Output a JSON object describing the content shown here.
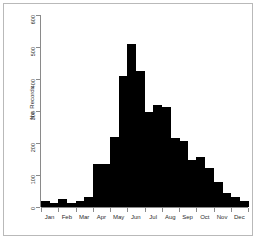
{
  "figure": {
    "background": "#ffffff",
    "border_color": "#b9b9b9",
    "bar_color": "#000000",
    "axis_color": "#8a8a8a"
  },
  "chart_data": {
    "type": "bar",
    "title": "",
    "xlabel": "",
    "ylabel": "No. Records",
    "ylim": [
      0,
      600
    ],
    "yticks": [
      0,
      100,
      200,
      300,
      400,
      500,
      600
    ],
    "ytick_labels": [
      "0",
      "100",
      "200",
      "300",
      "400",
      "500",
      "600"
    ],
    "grid": false,
    "legend": null,
    "xtick_labels": [
      "Jan",
      "Feb",
      "Mar",
      "Apr",
      "May",
      "Jun",
      "Jul",
      "Aug",
      "Sep",
      "Oct",
      "Nov",
      "Dec"
    ],
    "bin_note": "semi-monthly bins, two bars per month",
    "categories": [
      "Jan-1",
      "Jan-2",
      "Feb-1",
      "Feb-2",
      "Mar-1",
      "Mar-2",
      "Apr-1",
      "Apr-2",
      "May-1",
      "May-2",
      "Jun-1",
      "Jun-2",
      "Jul-1",
      "Jul-2",
      "Aug-1",
      "Aug-2",
      "Sep-1",
      "Sep-2",
      "Oct-1",
      "Oct-2",
      "Nov-1",
      "Nov-2",
      "Dec-1",
      "Dec-2"
    ],
    "values": [
      18,
      14,
      26,
      14,
      18,
      32,
      135,
      135,
      220,
      408,
      508,
      425,
      298,
      320,
      312,
      215,
      205,
      148,
      155,
      122,
      78,
      45,
      30,
      18
    ]
  }
}
